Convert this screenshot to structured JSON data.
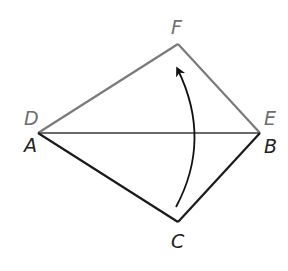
{
  "diagram": {
    "colors": {
      "image_color": "#7a7a7a",
      "preimage_color": "#1a1a1a",
      "arrow_color": "#111111",
      "label_image_color": "#6e6e6e",
      "label_preimage_color": "#222222"
    },
    "points": {
      "D": {
        "x": 38,
        "y": 133
      },
      "A": {
        "x": 38,
        "y": 133
      },
      "E": {
        "x": 260,
        "y": 133
      },
      "B": {
        "x": 260,
        "y": 133
      },
      "F": {
        "x": 178,
        "y": 44
      },
      "C": {
        "x": 178,
        "y": 222
      }
    },
    "labels": {
      "D": "D",
      "A": "A",
      "E": "E",
      "B": "B",
      "F": "F",
      "C": "C"
    },
    "arrow": {
      "from": "C",
      "to": "F",
      "type": "curved"
    }
  }
}
